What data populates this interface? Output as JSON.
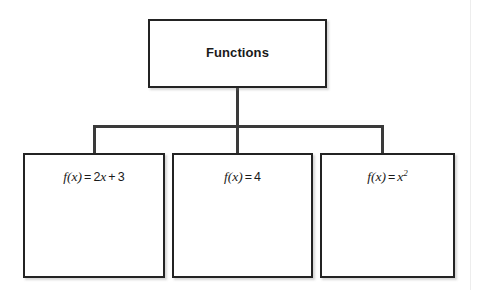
{
  "diagram": {
    "type": "tree",
    "orientation": "top-down",
    "root": {
      "label": "Functions",
      "bold": true
    },
    "children": [
      {
        "label": "f(x) = 2x + 3",
        "parts": {
          "fn": "f(x)",
          "eq": "=",
          "coeff": "2",
          "var": "x",
          "plus": "+",
          "const": "3"
        }
      },
      {
        "label": "f(x) = 4",
        "parts": {
          "fn": "f(x)",
          "eq": "=",
          "const": "4"
        }
      },
      {
        "label": "f(x) = x2",
        "parts": {
          "fn": "f(x)",
          "eq": "=",
          "var": "x",
          "exponent": "2"
        }
      }
    ],
    "colors": {
      "border": "#232323",
      "connector": "#3a3a3a",
      "background": "#ffffff",
      "text": "#1a1a1a"
    }
  }
}
